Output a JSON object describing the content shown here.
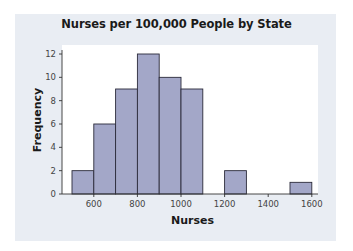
{
  "chart_data": {
    "type": "bar",
    "subtype": "histogram",
    "title": "Nurses per 100,000 People by State",
    "xlabel": "Nurses",
    "ylabel": "Frequency",
    "bins": [
      {
        "start": 500,
        "end": 600,
        "count": 2
      },
      {
        "start": 600,
        "end": 700,
        "count": 6
      },
      {
        "start": 700,
        "end": 800,
        "count": 9
      },
      {
        "start": 800,
        "end": 900,
        "count": 12
      },
      {
        "start": 900,
        "end": 1000,
        "count": 10
      },
      {
        "start": 1000,
        "end": 1100,
        "count": 9
      },
      {
        "start": 1100,
        "end": 1200,
        "count": 0
      },
      {
        "start": 1200,
        "end": 1300,
        "count": 2
      },
      {
        "start": 1300,
        "end": 1400,
        "count": 0
      },
      {
        "start": 1400,
        "end": 1500,
        "count": 0
      },
      {
        "start": 1500,
        "end": 1600,
        "count": 1
      }
    ],
    "categories": [
      "500-600",
      "600-700",
      "700-800",
      "800-900",
      "900-1000",
      "1000-1100",
      "1100-1200",
      "1200-1300",
      "1300-1400",
      "1400-1500",
      "1500-1600"
    ],
    "values": [
      2,
      6,
      9,
      12,
      10,
      9,
      0,
      2,
      0,
      0,
      1
    ],
    "x_ticks": [
      600,
      800,
      1000,
      1200,
      1400,
      1600
    ],
    "y_ticks": [
      0,
      2,
      4,
      6,
      8,
      10,
      12
    ],
    "xlim": [
      500,
      1600
    ],
    "ylim": [
      0,
      12
    ],
    "grid": false,
    "legend": null,
    "colors": {
      "bar_fill": "#a3a7c8",
      "bar_edge": "#2b2b3a",
      "panel": "#e9edf3",
      "plot_bg": "#ffffff"
    }
  }
}
